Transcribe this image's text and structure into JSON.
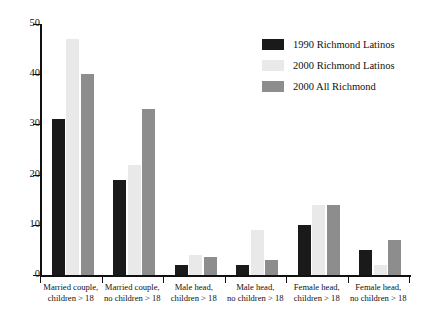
{
  "chart_data": {
    "type": "bar",
    "title": "",
    "xlabel": "",
    "ylabel": "",
    "ylim": [
      0,
      50
    ],
    "yticks": [
      0,
      10,
      20,
      30,
      40,
      50
    ],
    "grid": false,
    "legend_position": "top-right",
    "categories": [
      "Married couple, children > 18",
      "Married couple, no children > 18",
      "Male head, children > 18",
      "Male head, no children > 18",
      "Female head, children > 18",
      "Female head, no children > 18"
    ],
    "category_lines": [
      [
        "Married couple,",
        "children > 18"
      ],
      [
        "Married couple,",
        "no children > 18"
      ],
      [
        "Male head,",
        "children > 18"
      ],
      [
        "Male head,",
        "no children > 18"
      ],
      [
        "Female head,",
        "children > 18"
      ],
      [
        "Female head,",
        "no children > 18"
      ]
    ],
    "series": [
      {
        "name": "1990 Richmond Latinos",
        "color": "#1a1a1a",
        "values": [
          31,
          19,
          2,
          2,
          10,
          5
        ]
      },
      {
        "name": "2000 Richmond Latinos",
        "color": "#e9e9e9",
        "values": [
          47,
          22,
          4,
          9,
          14,
          2
        ]
      },
      {
        "name": "2000 All Richmond",
        "color": "#8d8d8d",
        "values": [
          40,
          33,
          3.5,
          3,
          14,
          7
        ]
      }
    ]
  },
  "legend": {
    "items": [
      {
        "label": "1990 Richmond Latinos",
        "color": "#1a1a1a"
      },
      {
        "label": "2000 Richmond Latinos",
        "color": "#e9e9e9"
      },
      {
        "label": "2000 All Richmond",
        "color": "#8d8d8d"
      }
    ]
  },
  "axes": {
    "y_tick_labels": [
      "0",
      "10",
      "20",
      "30",
      "40",
      "50"
    ]
  }
}
